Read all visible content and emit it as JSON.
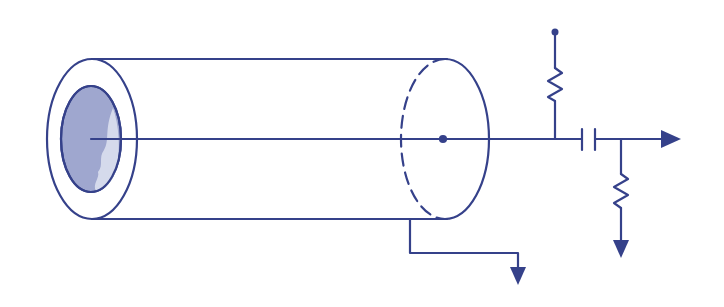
{
  "diagram": {
    "title": "",
    "colors": {
      "stroke": "#35418a",
      "inner_fill": "#9fa7cf",
      "inner_highlight": "#d5daec",
      "background": "#ffffff"
    },
    "components": [
      {
        "id": "coax-cable",
        "type": "cylinder"
      },
      {
        "id": "center-conductor",
        "type": "wire"
      },
      {
        "id": "shield-ground",
        "type": "ground-arrow"
      },
      {
        "id": "bias-resistor",
        "type": "resistor"
      },
      {
        "id": "supply-node",
        "type": "terminal-dot"
      },
      {
        "id": "coupling-capacitor",
        "type": "capacitor"
      },
      {
        "id": "load-resistor",
        "type": "resistor"
      },
      {
        "id": "load-ground",
        "type": "ground-arrow"
      },
      {
        "id": "output",
        "type": "arrow"
      }
    ]
  }
}
